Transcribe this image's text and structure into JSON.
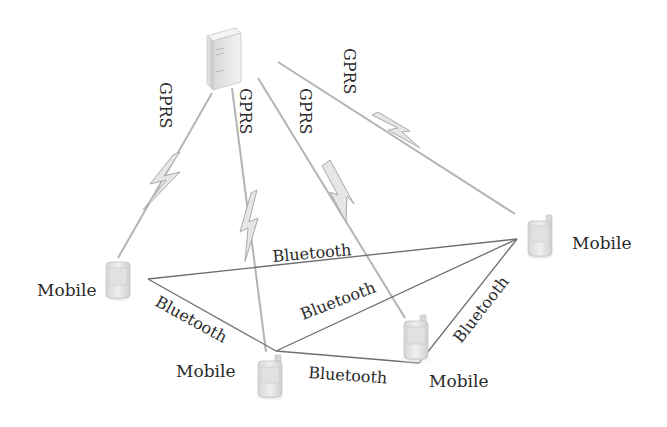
{
  "diagram": {
    "type": "network-topology",
    "nodes": [
      {
        "id": "server",
        "kind": "server",
        "label": ""
      },
      {
        "id": "m_left",
        "kind": "mobile",
        "label": "Mobile"
      },
      {
        "id": "m_right",
        "kind": "mobile",
        "label": "Mobile"
      },
      {
        "id": "m_bottom",
        "kind": "mobile",
        "label": "Mobile"
      },
      {
        "id": "m_mid",
        "kind": "mobile",
        "label": "Mobile"
      }
    ],
    "gprs_links": [
      {
        "from": "server",
        "to": "m_left",
        "label": "GPRS"
      },
      {
        "from": "server",
        "to": "m_bottom",
        "label": "GPRS"
      },
      {
        "from": "server",
        "to": "m_mid",
        "label": "GPRS"
      },
      {
        "from": "server",
        "to": "m_right",
        "label": "GPRS"
      }
    ],
    "bluetooth_links": [
      {
        "from": "m_left",
        "to": "m_right",
        "label": "Bluetooth"
      },
      {
        "from": "m_left",
        "to": "m_bottom",
        "label": "Bluetooth"
      },
      {
        "from": "m_bottom",
        "to": "m_right",
        "label": "Bluetooth"
      },
      {
        "from": "m_bottom",
        "to": "m_mid",
        "label": "Bluetooth"
      },
      {
        "from": "m_mid",
        "to": "m_right",
        "label": "Bluetooth"
      }
    ],
    "colors": {
      "bluetooth_line": "#6e6e6e",
      "gprs_line": "#b4b4b4",
      "text": "#2a2a2a"
    }
  }
}
